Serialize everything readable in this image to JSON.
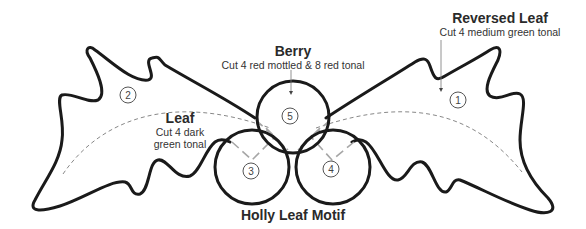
{
  "diagram": {
    "title": "Holly Leaf Motif",
    "parts": [
      {
        "id": "reversed-leaf",
        "number": "1",
        "name": "Reversed Leaf",
        "instruction": "Cut 4 medium green tonal"
      },
      {
        "id": "leaf",
        "number": "2",
        "name": "Leaf",
        "instruction_line1": "Cut 4 dark",
        "instruction_line2": "green tonal"
      },
      {
        "id": "berry-left",
        "number": "3"
      },
      {
        "id": "berry-right",
        "number": "4"
      },
      {
        "id": "berry",
        "number": "5",
        "name": "Berry",
        "instruction": "Cut 4 red mottled & 8 red tonal"
      }
    ],
    "colors": {
      "outline": "#1a1a1a",
      "guide": "#888888",
      "overlap": "#a6a6a6",
      "text": "#2a2a2a"
    }
  }
}
